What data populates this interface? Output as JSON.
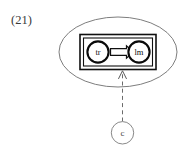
{
  "figure": {
    "number_label": "(21)",
    "caption": ""
  },
  "diagram": {
    "type": "state-transition-with-context",
    "outer_container": {
      "shape": "ellipse",
      "name": "situation-boundary",
      "stroke_color": "#6e6e6e"
    },
    "inner_container": {
      "shape": "double-rectangle",
      "name": "transition-frame",
      "stroke_color": "#101010"
    },
    "nodes": [
      {
        "id": "tr",
        "label": "tr",
        "shape": "circle",
        "position": "left",
        "stroke_color": "#0a0a0a"
      },
      {
        "id": "lm",
        "label": "lm",
        "shape": "circle",
        "position": "right",
        "stroke_color": "#0a0a0a"
      },
      {
        "id": "c",
        "label": "c",
        "shape": "circle",
        "position": "bottom",
        "stroke_color": "#7a7a7a"
      }
    ],
    "edges": [
      {
        "id": "tr-to-lm",
        "from": "tr",
        "to": "lm",
        "style": "double-line-hollow-arrow",
        "direction": "right",
        "label": ""
      },
      {
        "id": "c-to-frame",
        "from": "c",
        "to": "transition-frame",
        "style": "dashed-open-arrow",
        "direction": "up",
        "label": ""
      }
    ]
  }
}
